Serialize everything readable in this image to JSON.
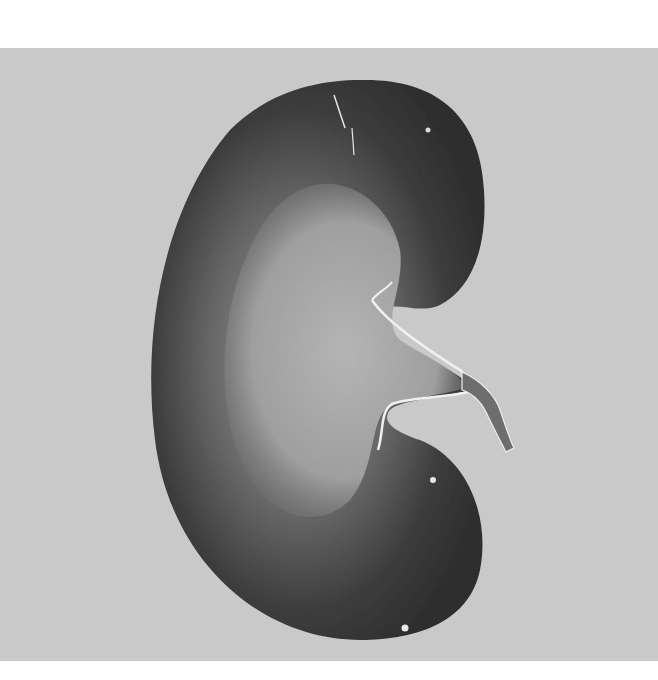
{
  "image": {
    "subject": "kidney-cross-section",
    "background_color": "#c9c9c9",
    "margin_color": "#ffffff",
    "cortex_color": "#3a3a3a",
    "medulla_color": "#a8a8a8",
    "pelvis_color": "#b5b5b5"
  }
}
